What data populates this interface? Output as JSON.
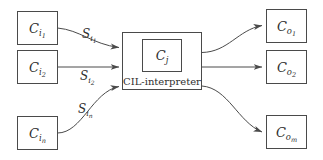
{
  "diagram": {
    "colors": {
      "stroke": "#4a4a4a",
      "text": "#2f2f2f",
      "background": "#ffffff"
    },
    "interpreter": {
      "caption": "CIL-interpreter",
      "inner_node": {
        "base": "C",
        "sub": "j"
      }
    },
    "inputs": [
      {
        "base": "C",
        "sub": "i1",
        "sub_main": "i",
        "sub_index": "1"
      },
      {
        "base": "C",
        "sub": "i2",
        "sub_main": "i",
        "sub_index": "2"
      },
      {
        "base": "C",
        "sub": "in",
        "sub_main": "i",
        "sub_index": "n"
      }
    ],
    "outputs": [
      {
        "base": "C",
        "sub": "o1",
        "sub_main": "o",
        "sub_index": "1"
      },
      {
        "base": "C",
        "sub": "o2",
        "sub_main": "o",
        "sub_index": "2"
      },
      {
        "base": "C",
        "sub": "om",
        "sub_main": "o",
        "sub_index": "m"
      }
    ],
    "edge_labels": [
      {
        "base": "S",
        "sub_main": "i",
        "sub_index": "1"
      },
      {
        "base": "S",
        "sub_main": "i",
        "sub_index": "2"
      },
      {
        "base": "S",
        "sub_main": "i",
        "sub_index": "n"
      }
    ]
  }
}
